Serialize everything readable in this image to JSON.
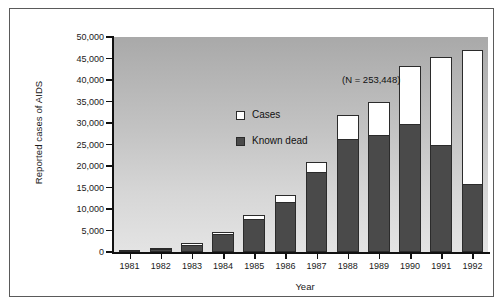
{
  "chart_data": {
    "type": "bar",
    "subtype": "stacked",
    "title": "",
    "xlabel": "Year",
    "ylabel": "Reported cases of AIDS",
    "annotation": "(N = 253,448)",
    "categories": [
      "1981",
      "1982",
      "1983",
      "1984",
      "1985",
      "1986",
      "1987",
      "1988",
      "1989",
      "1990",
      "1991",
      "1992"
    ],
    "series": [
      {
        "name": "Cases",
        "color": "#ffffff",
        "values": [
          400,
          850,
          2100,
          4600,
          8600,
          13200,
          20900,
          31800,
          35000,
          43300,
          45300,
          47000
        ]
      },
      {
        "name": "Known dead",
        "color": "#4a4a4a",
        "values": [
          300,
          650,
          1700,
          4200,
          7700,
          11600,
          18600,
          26200,
          27100,
          29800,
          24800,
          15800
        ]
      }
    ],
    "ylim": [
      0,
      50000
    ],
    "yticks": [
      0,
      5000,
      10000,
      15000,
      20000,
      25000,
      30000,
      35000,
      40000,
      45000,
      50000
    ],
    "ytick_labels": [
      "0",
      "5,000",
      "10,000",
      "15,000",
      "20,000",
      "25,000",
      "30,000",
      "35,000",
      "40,000",
      "45,000",
      "50,000"
    ],
    "grid": false,
    "legend_position": "upper-left",
    "legend_entries": [
      "Cases",
      "Known dead"
    ],
    "plot_background": "grey vertical gradient (dark top to light bottom)"
  }
}
